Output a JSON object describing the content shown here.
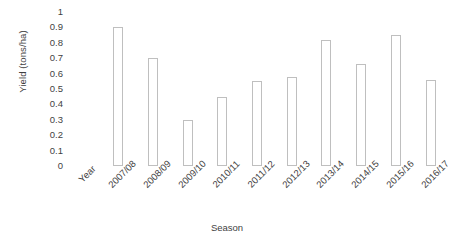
{
  "chart_data": {
    "type": "bar",
    "title": "",
    "xlabel": "Season",
    "ylabel": "Yield (tons/ha)",
    "categories": [
      "Year",
      "2007/08",
      "2008/09",
      "2009/10",
      "2010/11",
      "2011/12",
      "2012/13",
      "2013/14",
      "2014/15",
      "2015/16",
      "2016/17"
    ],
    "values": [
      null,
      0.9,
      0.7,
      0.3,
      0.45,
      0.55,
      0.58,
      0.82,
      0.66,
      0.85,
      0.56
    ],
    "ylim": [
      0,
      1
    ],
    "ytick_values": [
      0,
      0.1,
      0.2,
      0.3,
      0.4,
      0.5,
      0.6,
      0.7,
      0.8,
      0.9,
      1
    ],
    "ytick_labels": [
      "0",
      "0.1",
      "0.2",
      "0.3",
      "0.4",
      "0.5",
      "0.6",
      "0.7",
      "0.8",
      "0.9",
      "1"
    ],
    "grid": false,
    "legend": null,
    "bar_style": {
      "fill": "#ffffff",
      "border": "#bfbfbf"
    }
  },
  "axes": {
    "y_title": "Yield (tons/ha)",
    "x_title": "Season"
  }
}
